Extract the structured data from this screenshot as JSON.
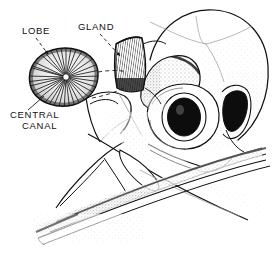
{
  "figure": {
    "background_color": "#ffffff",
    "ink_color": "#111111",
    "width": 276,
    "height": 257
  },
  "labels": [
    {
      "id": "lobe",
      "text": "LOBE",
      "x": 22,
      "y": 34,
      "leader": "dashed-arrow",
      "points_to": "gland-lobe-cross-section"
    },
    {
      "id": "gland",
      "text": "GLAND",
      "x": 78,
      "y": 30,
      "leader": "dashed-arrow",
      "points_to": "salt-gland-in-situ"
    },
    {
      "id": "central-canal-line1",
      "text": "CENTRAL",
      "x": 10,
      "y": 118,
      "leader": "thin-line",
      "points_to": "lobe-center"
    },
    {
      "id": "central-canal-line2",
      "text": "CANAL",
      "x": 22,
      "y": 129,
      "leader": "none",
      "points_to": "lobe-center"
    }
  ],
  "anatomy": {
    "parts": [
      {
        "name": "cranium",
        "description": "rounded braincase dome with faint suture lines and stipple shading"
      },
      {
        "name": "salt-gland",
        "description": "curved wedge-shaped supraorbital nasal gland with fine vertical striations"
      },
      {
        "name": "supraorbital-ridge",
        "description": "crescent stippled ridge above the orbit"
      },
      {
        "name": "orbit",
        "description": "large circular eye socket with dark filled sclerotic ring"
      },
      {
        "name": "temporal-fossa",
        "description": "dark opening at the posterior of the skull"
      },
      {
        "name": "upper-mandible",
        "description": "long tapering upper beak"
      },
      {
        "name": "lower-mandible",
        "description": "slender lower beak with dense stippled shading"
      },
      {
        "name": "jugal-bar",
        "description": "thin bony strut running from orbit to upper beak"
      },
      {
        "name": "nasal-opening",
        "description": "elongate narial aperture on the upper beak"
      }
    ],
    "inset": {
      "name": "gland-lobe-cross-section",
      "description": "rounded lobe in transverse section with radiating tubules converging on a central canal",
      "connector": "two dashed lines linking the inset to the gland base"
    }
  }
}
